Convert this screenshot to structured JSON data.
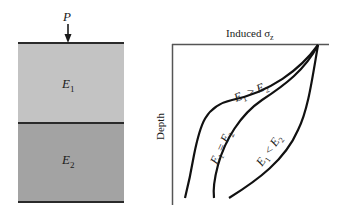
{
  "soil_profile": {
    "load_label": "P",
    "layers": [
      {
        "name": "E",
        "sub": "1",
        "color": "#c3c3c3"
      },
      {
        "name": "E",
        "sub": "2",
        "color": "#a3a3a3"
      }
    ]
  },
  "chart": {
    "x_axis_title": "Induced σ",
    "x_axis_sub": "z",
    "y_axis_title": "Depth",
    "curves": [
      {
        "label": "E₁ > E₂"
      },
      {
        "label": "E₁ = E₂"
      },
      {
        "label": "E₁ < E₂"
      }
    ]
  }
}
